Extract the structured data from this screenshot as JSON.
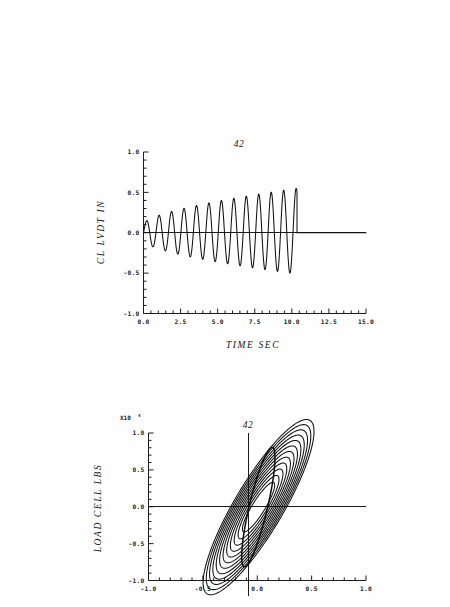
{
  "document": {
    "kind": "scanned-plot-page",
    "page_background": "#fefefe",
    "ink_color": "#111111"
  },
  "chart_data": [
    {
      "id": "cl-lvdt-time-history",
      "type": "line",
      "title": "42",
      "xlabel": "TIME   SEC",
      "ylabel": "CL LVDT  IN",
      "xlim": [
        0.0,
        15.0
      ],
      "ylim": [
        -1.0,
        1.0
      ],
      "xticks": [
        0.0,
        2.5,
        5.0,
        7.5,
        10.0,
        12.5,
        15.0
      ],
      "xticklabels": [
        "0.0",
        "2.5",
        "5.0",
        "7.5",
        "10.0",
        "12.5",
        "15.0"
      ],
      "yticks": [
        -1.0,
        -0.5,
        0.0,
        0.5,
        1.0
      ],
      "yticklabels": [
        "-1.0",
        "-0.5",
        "0.0",
        "0.5",
        "1.0"
      ],
      "minor_xticks_per_interval": 5,
      "minor_yticks_per_interval": 5,
      "grid": false,
      "legend": "none",
      "description": "Amplitude-growing sinusoidal displacement time history followed by a flat zero trace.",
      "series": [
        {
          "name": "CL LVDT displacement",
          "stroke": "#111111",
          "waveform": {
            "form": "growing-sinusoid-then-flat",
            "start_time": 0.0,
            "oscillation_end_time": 10.35,
            "flat_end_time": 15.0,
            "cycles": 12,
            "period_sec": 0.84,
            "amplitude_start": 0.11,
            "amplitude_end": 0.55,
            "amplitude_asymmetry": 0.93,
            "flat_level": 0.0
          },
          "cycle_peaks": [
            {
              "t": 0.1,
              "peak": 0.12,
              "trough": -0.09
            },
            {
              "t": 0.95,
              "peak": 0.17,
              "trough": -0.15
            },
            {
              "t": 1.78,
              "peak": 0.24,
              "trough": -0.21
            },
            {
              "t": 2.62,
              "peak": 0.3,
              "trough": -0.27
            },
            {
              "t": 3.45,
              "peak": 0.35,
              "trough": -0.32
            },
            {
              "t": 4.28,
              "peak": 0.4,
              "trough": -0.37
            },
            {
              "t": 5.12,
              "peak": 0.44,
              "trough": -0.41
            },
            {
              "t": 5.95,
              "peak": 0.47,
              "trough": -0.44
            },
            {
              "t": 6.78,
              "peak": 0.49,
              "trough": -0.46
            },
            {
              "t": 7.62,
              "peak": 0.51,
              "trough": -0.47
            },
            {
              "t": 8.45,
              "peak": 0.52,
              "trough": -0.48
            },
            {
              "t": 9.28,
              "peak": 0.53,
              "trough": -0.49
            },
            {
              "t": 10.12,
              "peak": 0.55,
              "trough": -0.49
            }
          ]
        }
      ]
    },
    {
      "id": "load-cell-hysteresis",
      "type": "line",
      "title": "42",
      "xlabel": "",
      "ylabel": "LOAD CELL LBS",
      "y_exponent_label": "X10",
      "y_exponent_power": "4",
      "xlim": [
        -1.0,
        1.0
      ],
      "ylim": [
        -1.0,
        1.0
      ],
      "xticks": [
        -1.0,
        -0.5,
        0.0,
        0.5,
        1.0
      ],
      "xticklabels": [
        "-1.0",
        "-0.5",
        "0.0",
        "0.5",
        "1.0"
      ],
      "yticks": [
        -1.0,
        -0.5,
        0.0,
        0.5,
        1.0
      ],
      "yticklabels": [
        "-1.0",
        "-0.5",
        "0.0",
        "0.5",
        "1.0"
      ],
      "minor_xticks_per_interval": 5,
      "minor_yticks_per_interval": 5,
      "grid": false,
      "zero_crosshair": true,
      "legend": "none",
      "description": "Nested growing hysteresis loops of load cell force versus displacement; inner loops small and narrow, outer envelope reaching x = -0.50 to 0.52 and y = -0.88 to 0.87.",
      "loops": {
        "count": 12,
        "skew_slope": 3.3,
        "x_extent_first": 0.1,
        "x_extent_last": 0.51,
        "y_extent_first": 0.14,
        "y_extent_last": 0.87,
        "pinch_width_first": 0.012,
        "pinch_width_last": 0.085,
        "envelope": {
          "x_min": -0.5,
          "x_max": 0.52,
          "y_min": -0.88,
          "y_max": 0.87,
          "stroke_width": 1.5
        }
      }
    }
  ]
}
